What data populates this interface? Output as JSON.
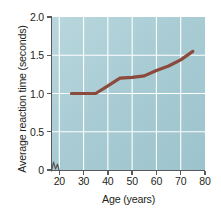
{
  "chart_data": {
    "type": "line",
    "title": "",
    "xlabel": "Age (years)",
    "ylabel": "Average reaction time (seconds)",
    "xlim": [
      17,
      80
    ],
    "ylim": [
      0,
      2.0
    ],
    "xticks": [
      20,
      30,
      40,
      50,
      60,
      70,
      80
    ],
    "xtick_labels": [
      "20",
      "30",
      "40",
      "50",
      "60",
      "70",
      "80"
    ],
    "yticks": [
      0,
      0.5,
      1.0,
      1.5,
      2.0
    ],
    "ytick_labels": [
      "0",
      "0.5",
      "1.0",
      "1.5",
      "2.0"
    ],
    "grid": true,
    "grid_color": "#ffffff",
    "legend": false,
    "axis_break": true,
    "plot_background": "#a9ccd4",
    "series": [
      {
        "name": "Average reaction time",
        "color": "#8b4a3c",
        "x": [
          25,
          30,
          35,
          40,
          45,
          50,
          55,
          60,
          65,
          70,
          75
        ],
        "values": [
          1.0,
          1.0,
          1.0,
          1.1,
          1.2,
          1.21,
          1.23,
          1.3,
          1.36,
          1.44,
          1.55
        ]
      }
    ]
  }
}
